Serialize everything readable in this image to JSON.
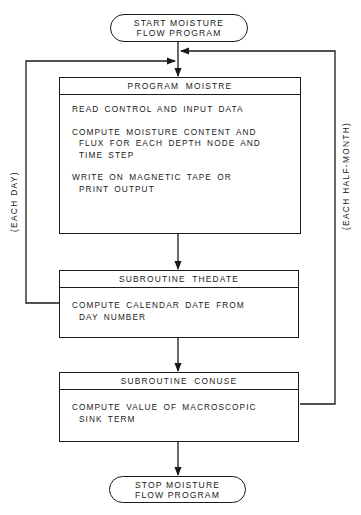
{
  "diagram": {
    "type": "flowchart",
    "start": {
      "lines": [
        "START MOISTURE",
        "FLOW PROGRAM"
      ]
    },
    "stop": {
      "lines": [
        "STOP MOISTURE",
        "FLOW PROGRAM"
      ]
    },
    "blocks": [
      {
        "title": "PROGRAM  MOISTRE",
        "steps": [
          [
            "READ CONTROL AND INPUT DATA"
          ],
          [
            "COMPUTE MOISTURE CONTENT AND",
            "FLUX FOR EACH DEPTH NODE AND",
            "TIME STEP"
          ],
          [
            "WRITE ON MAGNETIC TAPE OR",
            "PRINT OUTPUT"
          ]
        ]
      },
      {
        "title": "SUBROUTINE  THEDATE",
        "steps": [
          [
            "COMPUTE CALENDAR DATE FROM",
            "DAY NUMBER"
          ]
        ]
      },
      {
        "title": "SUBROUTINE  CONUSE",
        "steps": [
          [
            "COMPUTE VALUE OF MACROSCOPIC",
            "SINK TERM"
          ]
        ]
      }
    ],
    "loops": {
      "left": "(EACH DAY)",
      "right": "(EACH HALF-MONTH)"
    },
    "colors": {
      "ink": "#1a1a1a",
      "background": "#ffffff"
    }
  }
}
